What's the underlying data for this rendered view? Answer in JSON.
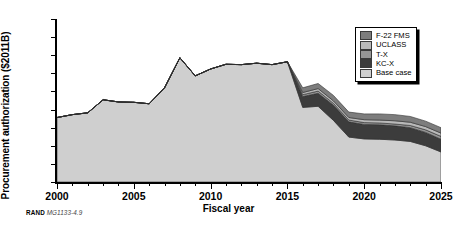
{
  "caption": {
    "brand": "RAND",
    "code": "MG1133-4.9"
  },
  "legend": {
    "position": "top-right",
    "items": [
      {
        "label": "F-22 FMS",
        "color": "#7d7d7d"
      },
      {
        "label": "UCLASS",
        "color": "#b9b9b9"
      },
      {
        "label": "T-X",
        "color": "#969696"
      },
      {
        "label": "KC-X",
        "color": "#3c3c3c"
      },
      {
        "label": "Base case",
        "color": "#cfcfcf"
      }
    ]
  },
  "chart_data": {
    "type": "area",
    "stacked": true,
    "title": "",
    "xlabel": "Fiscal year",
    "ylabel": "Procurement authorization ($2011B)",
    "xlim": [
      2000,
      2025
    ],
    "ylim": [
      0,
      45
    ],
    "ytick_values": [
      0,
      5,
      10,
      15,
      20,
      25,
      30,
      35,
      40,
      45
    ],
    "xtick_values": [
      2000,
      2005,
      2010,
      2015,
      2020,
      2025
    ],
    "xtick_labels": [
      "2000",
      "2005",
      "2010",
      "2015",
      "2020",
      "2025"
    ],
    "x_minor_tick_interval": 1,
    "grid": false,
    "x": [
      2000,
      2001,
      2002,
      2003,
      2004,
      2005,
      2006,
      2007,
      2008,
      2009,
      2010,
      2011,
      2012,
      2013,
      2014,
      2015,
      2016,
      2017,
      2018,
      2019,
      2020,
      2021,
      2022,
      2023,
      2024,
      2025
    ],
    "series": [
      {
        "name": "Base case",
        "color": "#cfcfcf",
        "values": [
          17.8,
          18.6,
          19.1,
          22.7,
          22.1,
          22.0,
          21.6,
          26.0,
          34.3,
          29.3,
          31.2,
          32.5,
          32.4,
          32.8,
          32.4,
          33.2,
          20.6,
          20.9,
          17.0,
          12.4,
          11.9,
          11.8,
          11.6,
          11.2,
          10.0,
          8.3
        ]
      },
      {
        "name": "KC-X",
        "color": "#3c3c3c",
        "values": [
          0,
          0,
          0,
          0,
          0,
          0,
          0,
          0,
          0,
          0,
          0,
          0,
          0,
          0,
          0,
          0,
          3.0,
          3.6,
          4.2,
          4.2,
          4.0,
          4.0,
          3.9,
          3.8,
          3.7,
          3.5
        ]
      },
      {
        "name": "T-X",
        "color": "#969696",
        "values": [
          0,
          0,
          0,
          0,
          0,
          0,
          0,
          0,
          0,
          0,
          0,
          0,
          0,
          0,
          0,
          0,
          0.5,
          0.6,
          0.5,
          0.5,
          0.5,
          0.5,
          0.5,
          0.6,
          0.7,
          0.8
        ]
      },
      {
        "name": "UCLASS",
        "color": "#b9b9b9",
        "values": [
          0,
          0,
          0,
          0,
          0,
          0,
          0,
          0,
          0,
          0,
          0,
          0,
          0,
          0,
          0,
          0,
          0.6,
          0.7,
          0.7,
          0.7,
          0.8,
          0.8,
          0.9,
          0.9,
          0.9,
          0.9
        ]
      },
      {
        "name": "F-22 FMS",
        "color": "#7d7d7d",
        "values": [
          0,
          0,
          0,
          0,
          0,
          0,
          0,
          0,
          0,
          0,
          0,
          0,
          0,
          0,
          0,
          0,
          1.3,
          1.4,
          1.5,
          1.5,
          1.6,
          1.7,
          1.7,
          1.6,
          1.5,
          1.5
        ]
      }
    ]
  }
}
